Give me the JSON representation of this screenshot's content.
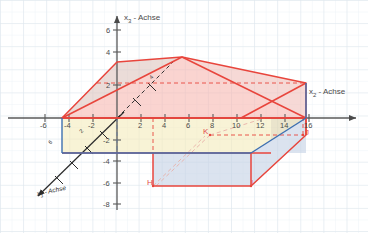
{
  "figure": {
    "title_present": false,
    "background_color": "#ffffff",
    "grid_minor_color": "#e8eef3",
    "grid_major_color": "#d6dfe8",
    "axis_color": "#5a5a5a"
  },
  "axes": {
    "x2": {
      "label": "x",
      "label_sub": "2",
      "label_suffix": "- Achse",
      "ticks": [
        -6,
        -4,
        -2,
        2,
        4,
        6,
        8,
        10,
        12,
        14,
        16
      ],
      "tick_labels": [
        "-6",
        "-4",
        "-2",
        "2",
        "4",
        "6",
        "8",
        "10",
        "12",
        "14",
        "16"
      ],
      "range": [
        -8,
        18
      ]
    },
    "x3": {
      "label": "x",
      "label_sub": "3",
      "label_suffix": "- Achse",
      "ticks": [
        -8,
        -6,
        -4,
        -2,
        2,
        4,
        6
      ],
      "tick_labels": [
        "-8",
        "-6",
        "-4",
        "-2",
        "2",
        "4",
        "6"
      ],
      "range": [
        -9,
        7
      ]
    },
    "x1": {
      "label": "x",
      "label_sub": "1",
      "label_suffix": "- Achse",
      "tick_marks": [
        1,
        2,
        3,
        4,
        5
      ],
      "tick_value_labels": [
        "2",
        "4",
        "6"
      ],
      "direction": "down-left-diagonal"
    }
  },
  "point_labels": [
    {
      "name": "H",
      "text": "H",
      "x": 147,
      "y": 184,
      "color": "#e24a4a"
    },
    {
      "name": "I",
      "text": "I",
      "x": 251,
      "y": 184,
      "color": "#e24a4a"
    },
    {
      "name": "J",
      "text": "J",
      "x": 303,
      "y": 135,
      "color": "#e24a4a"
    },
    {
      "name": "K",
      "text": "K",
      "x": 203,
      "y": 128,
      "color": "#e24a4a"
    }
  ],
  "colors": {
    "edge_red": "#e8453c",
    "edge_blue": "#3d6fb0",
    "fill_red": "#f6b7b2",
    "fill_yellow": "#f6eec0",
    "fill_blue": "#ccd8e8",
    "fill_olive": "#ded6b8",
    "dashed_red": "#e8453c",
    "dashed_black": "#333333",
    "axis_text": "#4a4a4a"
  },
  "shapes": {
    "description": "3D prism with a pyramid roof drawn in an oblique coordinate system",
    "body": "rectangular box with yellow front face and blue side faces",
    "roof": "pink/red pyramid faces rising to an apex"
  }
}
